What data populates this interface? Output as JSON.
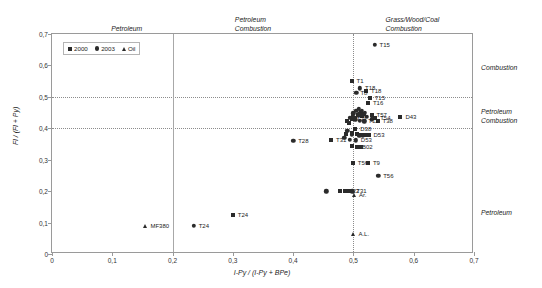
{
  "chart_data": {
    "type": "scatter",
    "title": "",
    "xlabel": "I-Py / (I-Py + BPe)",
    "ylabel": "Fl / (Fl + Py)",
    "xlim": [
      0,
      0.7
    ],
    "ylim": [
      0,
      0.7
    ],
    "xticks": [
      "0",
      "0,1",
      "0,2",
      "0,3",
      "0,4",
      "0,5",
      "0,6",
      "0,7"
    ],
    "xtick_values": [
      0,
      0.1,
      0.2,
      0.3,
      0.4,
      0.5,
      0.6,
      0.7
    ],
    "yticks": [
      "0",
      "0,1",
      "0,2",
      "0,3",
      "0,4",
      "0,5",
      "0,6",
      "0,7"
    ],
    "ytick_values": [
      0,
      0.1,
      0.2,
      0.3,
      0.4,
      0.5,
      0.6,
      0.7
    ],
    "grid": true,
    "grid_lines_h": [
      0.4,
      0.5
    ],
    "grid_lines_v": [
      0.2,
      0.5
    ],
    "legend_position": "top-left",
    "legend": [
      {
        "label": "2000",
        "marker": "square"
      },
      {
        "label": "2003",
        "marker": "circle"
      },
      {
        "label": "Oil",
        "marker": "triangle"
      }
    ],
    "zone_labels_top": [
      {
        "text": "Petroleum",
        "x": 0.1
      },
      {
        "text": "Petroleum\nCombustion",
        "x": 0.305
      },
      {
        "text": "Grass/Wood/Coal\nCombustion",
        "x": 0.555
      }
    ],
    "zone_labels_right": [
      {
        "text": "Combustion",
        "y": 0.585
      },
      {
        "text": "Petroleum\nCombustion",
        "y": 0.445
      },
      {
        "text": "Petroleum",
        "y": 0.125
      }
    ],
    "series": [
      {
        "name": "2000",
        "marker": "square",
        "points": [
          {
            "x": 0.3,
            "y": 0.125,
            "label": "T24",
            "lx": 5,
            "ly": 0
          },
          {
            "x": 0.497,
            "y": 0.55,
            "label": "T1",
            "lx": 5,
            "ly": 0
          },
          {
            "x": 0.521,
            "y": 0.52,
            "label": "T18",
            "lx": 5,
            "ly": 0
          },
          {
            "x": 0.527,
            "y": 0.497,
            "label": "T15",
            "lx": 5,
            "ly": 0
          },
          {
            "x": 0.524,
            "y": 0.479,
            "label": "T16",
            "lx": 5,
            "ly": 0
          },
          {
            "x": 0.512,
            "y": 0.451,
            "label": "",
            "lx": 4,
            "ly": 0
          },
          {
            "x": 0.518,
            "y": 0.447,
            "label": "",
            "lx": 4,
            "ly": 0
          },
          {
            "x": 0.508,
            "y": 0.443,
            "label": "",
            "lx": 4,
            "ly": 0
          },
          {
            "x": 0.514,
            "y": 0.438,
            "label": "",
            "lx": 4,
            "ly": 0
          },
          {
            "x": 0.503,
            "y": 0.432,
            "label": "",
            "lx": 4,
            "ly": 0
          },
          {
            "x": 0.497,
            "y": 0.428,
            "label": "T31",
            "lx": 5,
            "ly": 0
          },
          {
            "x": 0.489,
            "y": 0.424,
            "label": "",
            "lx": 4,
            "ly": 0
          },
          {
            "x": 0.53,
            "y": 0.442,
            "label": "T57",
            "lx": 5,
            "ly": 0
          },
          {
            "x": 0.536,
            "y": 0.434,
            "label": "T54",
            "lx": 5,
            "ly": 0
          },
          {
            "x": 0.54,
            "y": 0.424,
            "label": "T38",
            "lx": 5,
            "ly": 0
          },
          {
            "x": 0.578,
            "y": 0.435,
            "label": "D43",
            "lx": 5,
            "ly": 0
          },
          {
            "x": 0.493,
            "y": 0.417,
            "label": "",
            "lx": 4,
            "ly": 0
          },
          {
            "x": 0.503,
            "y": 0.397,
            "label": "D38",
            "lx": 5,
            "ly": 0
          },
          {
            "x": 0.498,
            "y": 0.385,
            "label": "",
            "lx": 4,
            "ly": 0
          },
          {
            "x": 0.506,
            "y": 0.382,
            "label": "",
            "lx": 4,
            "ly": 0
          },
          {
            "x": 0.513,
            "y": 0.38,
            "label": "",
            "lx": 4,
            "ly": 0
          },
          {
            "x": 0.519,
            "y": 0.378,
            "label": "",
            "lx": 4,
            "ly": 0
          },
          {
            "x": 0.525,
            "y": 0.379,
            "label": "D53",
            "lx": 5,
            "ly": 0
          },
          {
            "x": 0.488,
            "y": 0.383,
            "label": "",
            "lx": 4,
            "ly": 0
          },
          {
            "x": 0.463,
            "y": 0.362,
            "label": "T31",
            "lx": 5,
            "ly": 0
          },
          {
            "x": 0.497,
            "y": 0.343,
            "label": "",
            "lx": 4,
            "ly": 0
          },
          {
            "x": 0.506,
            "y": 0.341,
            "label": "B02",
            "lx": 5,
            "ly": 0
          },
          {
            "x": 0.513,
            "y": 0.341,
            "label": "",
            "lx": 4,
            "ly": 0
          },
          {
            "x": 0.499,
            "y": 0.288,
            "label": "T56",
            "lx": 5,
            "ly": 0
          },
          {
            "x": 0.524,
            "y": 0.29,
            "label": "T9",
            "lx": 5,
            "ly": 0
          },
          {
            "x": 0.478,
            "y": 0.202,
            "label": "",
            "lx": 4,
            "ly": 0
          },
          {
            "x": 0.486,
            "y": 0.2,
            "label": "T22",
            "lx": 4,
            "ly": 0
          },
          {
            "x": 0.492,
            "y": 0.2,
            "label": "",
            "lx": 4,
            "ly": 0
          }
        ]
      },
      {
        "name": "2003",
        "marker": "circle",
        "points": [
          {
            "x": 0.235,
            "y": 0.09,
            "label": "T24",
            "lx": 5,
            "ly": 0
          },
          {
            "x": 0.535,
            "y": 0.665,
            "label": "T15",
            "lx": 5,
            "ly": 0
          },
          {
            "x": 0.511,
            "y": 0.527,
            "label": "T18",
            "lx": 5,
            "ly": 0
          },
          {
            "x": 0.505,
            "y": 0.513,
            "label": "T8",
            "lx": 4,
            "ly": 0
          },
          {
            "x": 0.509,
            "y": 0.462,
            "label": "",
            "lx": 4,
            "ly": 0
          },
          {
            "x": 0.505,
            "y": 0.456,
            "label": "",
            "lx": 4,
            "ly": 0
          },
          {
            "x": 0.514,
            "y": 0.455,
            "label": "",
            "lx": 4,
            "ly": 0
          },
          {
            "x": 0.519,
            "y": 0.45,
            "label": "",
            "lx": 4,
            "ly": 0
          },
          {
            "x": 0.5,
            "y": 0.448,
            "label": "",
            "lx": 4,
            "ly": 0
          },
          {
            "x": 0.509,
            "y": 0.444,
            "label": "",
            "lx": 4,
            "ly": 0
          },
          {
            "x": 0.516,
            "y": 0.441,
            "label": "",
            "lx": 4,
            "ly": 0
          },
          {
            "x": 0.522,
            "y": 0.437,
            "label": "",
            "lx": 4,
            "ly": 0
          },
          {
            "x": 0.53,
            "y": 0.428,
            "label": "",
            "lx": 4,
            "ly": 0
          },
          {
            "x": 0.499,
            "y": 0.438,
            "label": "",
            "lx": 4,
            "ly": 0
          },
          {
            "x": 0.494,
            "y": 0.433,
            "label": "",
            "lx": 4,
            "ly": 0
          },
          {
            "x": 0.503,
            "y": 0.427,
            "label": "",
            "lx": 4,
            "ly": 0
          },
          {
            "x": 0.511,
            "y": 0.424,
            "label": "",
            "lx": 4,
            "ly": 0
          },
          {
            "x": 0.518,
            "y": 0.422,
            "label": "T11",
            "lx": 4,
            "ly": 0
          },
          {
            "x": 0.4,
            "y": 0.36,
            "label": "T28",
            "lx": 5,
            "ly": 0
          },
          {
            "x": 0.49,
            "y": 0.392,
            "label": "",
            "lx": 4,
            "ly": 0
          },
          {
            "x": 0.497,
            "y": 0.379,
            "label": "",
            "lx": 4,
            "ly": 0
          },
          {
            "x": 0.51,
            "y": 0.377,
            "label": "",
            "lx": 4,
            "ly": 0
          },
          {
            "x": 0.516,
            "y": 0.377,
            "label": "",
            "lx": 4,
            "ly": 0
          },
          {
            "x": 0.485,
            "y": 0.37,
            "label": "",
            "lx": 4,
            "ly": 0
          },
          {
            "x": 0.494,
            "y": 0.363,
            "label": "",
            "lx": 4,
            "ly": 0
          },
          {
            "x": 0.504,
            "y": 0.362,
            "label": "D53",
            "lx": 5,
            "ly": 0
          },
          {
            "x": 0.541,
            "y": 0.248,
            "label": "T56",
            "lx": 5,
            "ly": 0
          },
          {
            "x": 0.455,
            "y": 0.2,
            "label": "",
            "lx": 4,
            "ly": 0
          },
          {
            "x": 0.498,
            "y": 0.2,
            "label": "T31",
            "lx": 4,
            "ly": 0
          }
        ]
      },
      {
        "name": "Oil",
        "marker": "triangle",
        "points": [
          {
            "x": 0.155,
            "y": 0.09,
            "label": "MF380",
            "lx": 5,
            "ly": 0
          },
          {
            "x": 0.501,
            "y": 0.188,
            "label": "Ar.",
            "lx": 5,
            "ly": 0
          },
          {
            "x": 0.5,
            "y": 0.063,
            "label": "A.L.",
            "lx": 5,
            "ly": 0
          }
        ]
      }
    ]
  }
}
